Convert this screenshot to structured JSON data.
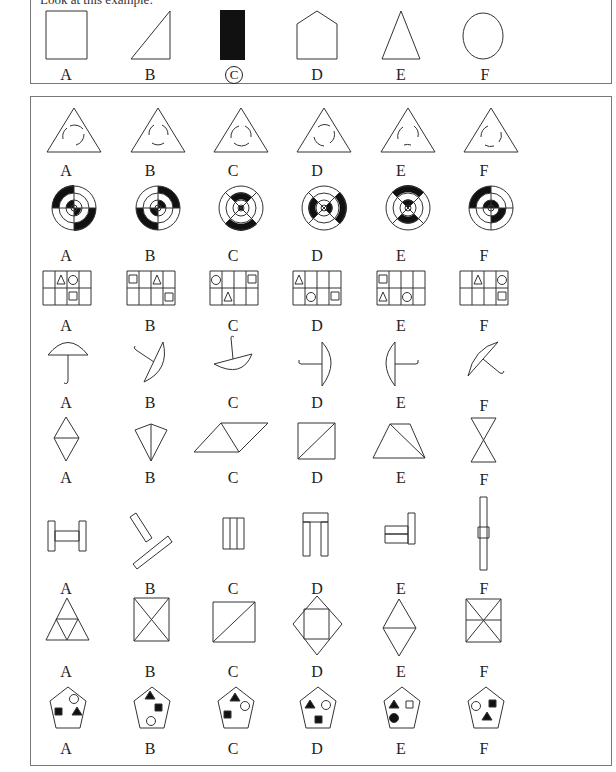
{
  "intro_text": "Look at this example:",
  "example": {
    "options": [
      {
        "label": "A",
        "shape": "square",
        "selected": false
      },
      {
        "label": "B",
        "shape": "right-triangle",
        "selected": false
      },
      {
        "label": "C",
        "shape": "black-rectangle",
        "selected": true
      },
      {
        "label": "D",
        "shape": "pentagon-house",
        "selected": false
      },
      {
        "label": "E",
        "shape": "triangle",
        "selected": false
      },
      {
        "label": "F",
        "shape": "circle",
        "selected": false
      }
    ]
  },
  "questions": [
    {
      "id": 1,
      "topic": "triangle-with-circular-arrows",
      "labels": [
        "A",
        "B",
        "C",
        "D",
        "E",
        "F"
      ]
    },
    {
      "id": 2,
      "topic": "target-with-black-segments",
      "labels": [
        "A",
        "B",
        "C",
        "D",
        "E",
        "F"
      ]
    },
    {
      "id": 3,
      "topic": "grid-with-triangle-circle-square",
      "labels": [
        "A",
        "B",
        "C",
        "D",
        "E",
        "F"
      ]
    },
    {
      "id": 4,
      "topic": "rotated-umbrella",
      "labels": [
        "A",
        "B",
        "C",
        "D",
        "E",
        "F"
      ]
    },
    {
      "id": 5,
      "topic": "two-triangles-composite",
      "labels": [
        "A",
        "B",
        "C",
        "D",
        "E",
        "F"
      ]
    },
    {
      "id": 6,
      "topic": "rectangle-bars",
      "labels": [
        "A",
        "B",
        "C",
        "D",
        "E",
        "F"
      ]
    },
    {
      "id": 7,
      "topic": "subdivided-polygons",
      "labels": [
        "A",
        "B",
        "C",
        "D",
        "E",
        "F"
      ]
    },
    {
      "id": 8,
      "topic": "pentagon-with-shapes",
      "labels": [
        "A",
        "B",
        "C",
        "D",
        "E",
        "F"
      ]
    }
  ]
}
